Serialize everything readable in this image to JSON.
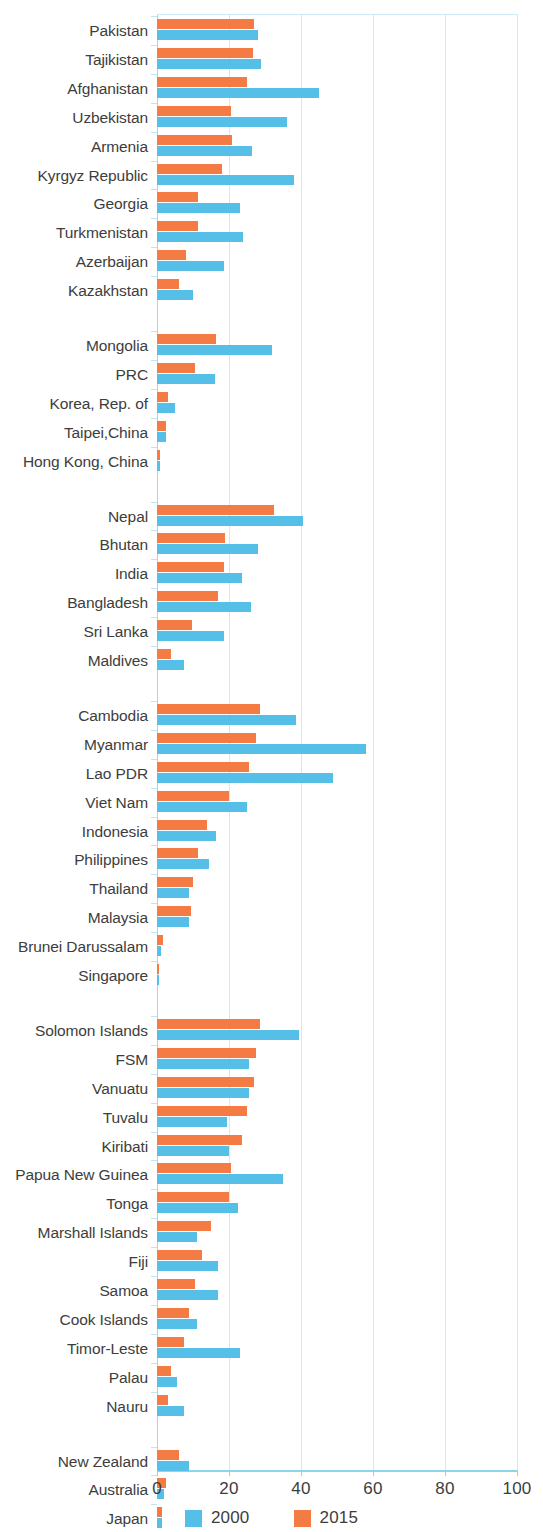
{
  "chart_data": {
    "type": "bar",
    "orientation": "horizontal",
    "title": "",
    "subtitle": "",
    "xlabel": "",
    "ylabel": "",
    "xlim": [
      0,
      100
    ],
    "xticks": [
      0,
      20,
      40,
      60,
      80,
      100
    ],
    "grid": true,
    "legend_position": "bottom",
    "colors": {
      "y2000": "#55bfe8",
      "y2015": "#f47b43",
      "grid": "#cfeaf5",
      "axis": "#8fd3ec"
    },
    "series": [
      {
        "name": "2000",
        "key": "y2000",
        "color": "#55bfe8"
      },
      {
        "name": "2015",
        "key": "y2015",
        "color": "#f47b43"
      }
    ],
    "groups": [
      {
        "name": "central-west-asia",
        "rows": [
          {
            "label": "Pakistan",
            "y2015": 27.0,
            "y2000": 28.0
          },
          {
            "label": "Tajikistan",
            "y2015": 26.8,
            "y2000": 29.0
          },
          {
            "label": "Afghanistan",
            "y2015": 25.0,
            "y2000": 45.0
          },
          {
            "label": "Uzbekistan",
            "y2015": 20.5,
            "y2000": 36.0
          },
          {
            "label": "Armenia",
            "y2015": 20.8,
            "y2000": 26.5
          },
          {
            "label": "Kyrgyz Republic",
            "y2015": 18.0,
            "y2000": 38.0
          },
          {
            "label": "Georgia",
            "y2015": 11.5,
            "y2000": 23.0
          },
          {
            "label": "Turkmenistan",
            "y2015": 11.5,
            "y2000": 24.0
          },
          {
            "label": "Azerbaijan",
            "y2015": 8.0,
            "y2000": 18.5
          },
          {
            "label": "Kazakhstan",
            "y2015": 6.0,
            "y2000": 10.0
          }
        ]
      },
      {
        "name": "east-asia",
        "rows": [
          {
            "label": "Mongolia",
            "y2015": 16.5,
            "y2000": 32.0
          },
          {
            "label": "PRC",
            "y2015": 10.5,
            "y2000": 16.0
          },
          {
            "label": "Korea, Rep. of",
            "y2015": 3.0,
            "y2000": 5.0
          },
          {
            "label": "Taipei,China",
            "y2015": 2.6,
            "y2000": 2.4
          },
          {
            "label": "Hong Kong, China",
            "y2015": 0.7,
            "y2000": 0.7
          }
        ]
      },
      {
        "name": "south-asia",
        "rows": [
          {
            "label": "Nepal",
            "y2015": 32.5,
            "y2000": 40.5
          },
          {
            "label": "Bhutan",
            "y2015": 19.0,
            "y2000": 28.0
          },
          {
            "label": "India",
            "y2015": 18.5,
            "y2000": 23.5
          },
          {
            "label": "Bangladesh",
            "y2015": 17.0,
            "y2000": 26.0
          },
          {
            "label": "Sri Lanka",
            "y2015": 9.8,
            "y2000": 18.5
          },
          {
            "label": "Maldives",
            "y2015": 4.0,
            "y2000": 7.5
          }
        ]
      },
      {
        "name": "southeast-asia",
        "rows": [
          {
            "label": "Cambodia",
            "y2015": 28.5,
            "y2000": 38.5
          },
          {
            "label": "Myanmar",
            "y2015": 27.5,
            "y2000": 58.0
          },
          {
            "label": "Lao PDR",
            "y2015": 25.5,
            "y2000": 49.0
          },
          {
            "label": "Viet Nam",
            "y2015": 20.0,
            "y2000": 25.0
          },
          {
            "label": "Indonesia",
            "y2015": 14.0,
            "y2000": 16.5
          },
          {
            "label": "Philippines",
            "y2015": 11.5,
            "y2000": 14.5
          },
          {
            "label": "Thailand",
            "y2015": 10.0,
            "y2000": 9.0
          },
          {
            "label": "Malaysia",
            "y2015": 9.5,
            "y2000": 9.0
          },
          {
            "label": "Brunei Darussalam",
            "y2015": 1.6,
            "y2000": 1.2
          },
          {
            "label": "Singapore",
            "y2015": 0.6,
            "y2000": 0.6
          }
        ]
      },
      {
        "name": "pacific",
        "rows": [
          {
            "label": "Solomon Islands",
            "y2015": 28.5,
            "y2000": 39.5
          },
          {
            "label": "FSM",
            "y2015": 27.5,
            "y2000": 25.5
          },
          {
            "label": "Vanuatu",
            "y2015": 27.0,
            "y2000": 25.5
          },
          {
            "label": "Tuvalu",
            "y2015": 25.0,
            "y2000": 19.5
          },
          {
            "label": "Kiribati",
            "y2015": 23.5,
            "y2000": 20.0
          },
          {
            "label": "Papua New Guinea",
            "y2015": 20.5,
            "y2000": 35.0
          },
          {
            "label": "Tonga",
            "y2015": 20.0,
            "y2000": 22.5
          },
          {
            "label": "Marshall Islands",
            "y2015": 15.0,
            "y2000": 11.0
          },
          {
            "label": "Fiji",
            "y2015": 12.5,
            "y2000": 17.0
          },
          {
            "label": "Samoa",
            "y2015": 10.5,
            "y2000": 17.0
          },
          {
            "label": "Cook Islands",
            "y2015": 9.0,
            "y2000": 11.0
          },
          {
            "label": "Timor-Leste",
            "y2015": 7.5,
            "y2000": 23.0
          },
          {
            "label": "Palau",
            "y2015": 4.0,
            "y2000": 5.5
          },
          {
            "label": "Nauru",
            "y2015": 3.0,
            "y2000": 7.5
          }
        ]
      },
      {
        "name": "developed",
        "rows": [
          {
            "label": "New Zealand",
            "y2015": 6.0,
            "y2000": 9.0
          },
          {
            "label": "Australia",
            "y2015": 2.5,
            "y2000": 2.0
          },
          {
            "label": "Japan",
            "y2015": 1.5,
            "y2000": 1.5
          }
        ]
      }
    ],
    "legend": [
      {
        "label": "2000",
        "color": "#55bfe8"
      },
      {
        "label": "2015",
        "color": "#f47b43"
      }
    ]
  }
}
